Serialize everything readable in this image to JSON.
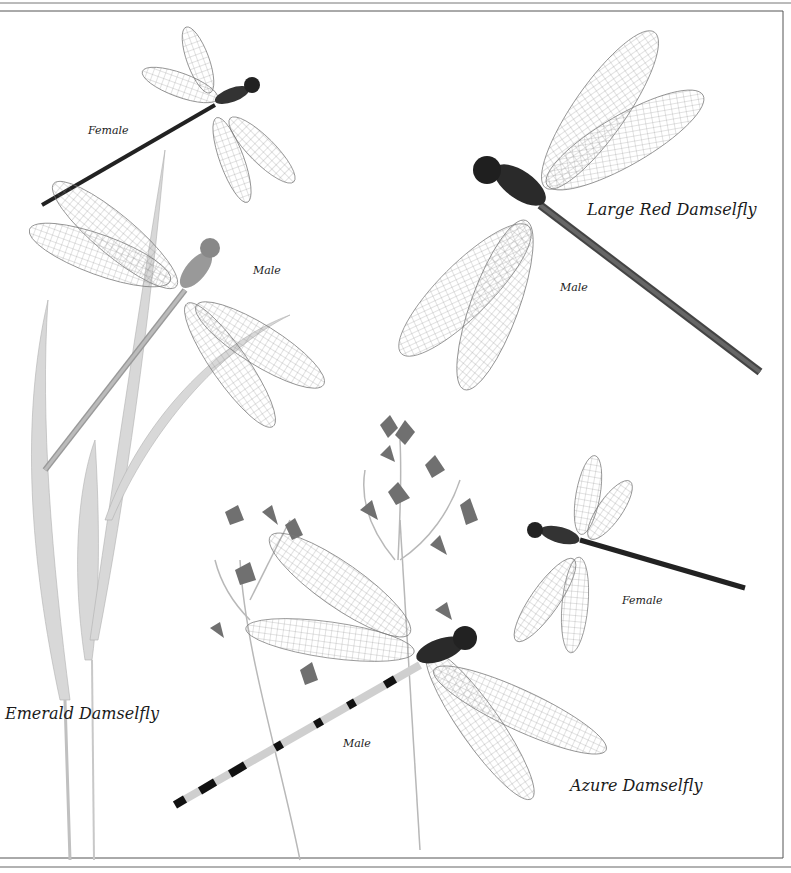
{
  "plate": {
    "species": [
      {
        "name": "Emerald Damselfly",
        "specimens": [
          {
            "sex": "Female"
          },
          {
            "sex": "Male"
          }
        ]
      },
      {
        "name": "Large Red Damselfly",
        "specimens": [
          {
            "sex": "Male"
          }
        ]
      },
      {
        "name": "Azure Damselfly",
        "specimens": [
          {
            "sex": "Female"
          },
          {
            "sex": "Male"
          }
        ]
      }
    ],
    "colors": {
      "background": "#ffffff",
      "ink": "#1a1a1a",
      "wing_vein": "#6a6a6a",
      "plant": "#b8b8b8",
      "frame": "#555555"
    }
  }
}
